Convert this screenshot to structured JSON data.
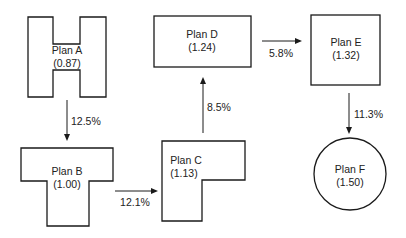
{
  "diagram": {
    "type": "flow",
    "colors": {
      "stroke": "#1a1a1a",
      "text": "#222222",
      "background": "#ffffff"
    },
    "nodes": [
      {
        "id": "A",
        "shape": "H-shape",
        "name": "Plan A",
        "value": "(0.87)"
      },
      {
        "id": "B",
        "shape": "T-shape",
        "name": "Plan B",
        "value": "(1.00)"
      },
      {
        "id": "C",
        "shape": "L-shape",
        "name": "Plan C",
        "value": "(1.13)"
      },
      {
        "id": "D",
        "shape": "rectangle",
        "name": "Plan D",
        "value": "(1.24)"
      },
      {
        "id": "E",
        "shape": "square",
        "name": "Plan E",
        "value": "(1.32)"
      },
      {
        "id": "F",
        "shape": "circle",
        "name": "Plan F",
        "value": "(1.50)"
      }
    ],
    "edges": [
      {
        "from": "A",
        "to": "B",
        "label": "12.5%"
      },
      {
        "from": "B",
        "to": "C",
        "label": "12.1%"
      },
      {
        "from": "C",
        "to": "D",
        "label": "8.5%"
      },
      {
        "from": "D",
        "to": "E",
        "label": "5.8%"
      },
      {
        "from": "E",
        "to": "F",
        "label": "11.3%"
      }
    ]
  }
}
